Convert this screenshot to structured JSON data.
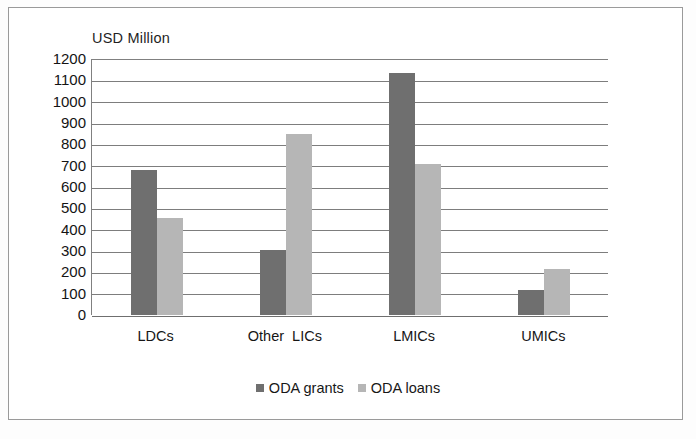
{
  "chart_data": {
    "type": "bar",
    "title": "",
    "subtitle": "",
    "xlabel": "",
    "ylabel": "USD Million",
    "ylim": [
      0,
      1200
    ],
    "ytick_step": 100,
    "yticks": [
      "1200",
      "1100",
      "1000",
      "900",
      "800",
      "700",
      "600",
      "500",
      "400",
      "300",
      "200",
      "100",
      "0"
    ],
    "ytick_values": [
      1200,
      1100,
      1000,
      900,
      800,
      700,
      600,
      500,
      400,
      300,
      200,
      100,
      0
    ],
    "grid": true,
    "legend_position": "bottom",
    "categories": [
      "LDCs",
      "Other  LICs",
      "LMICs",
      "UMICs"
    ],
    "series": [
      {
        "name": "ODA grants",
        "color": "#6f6f6f",
        "values": [
          680,
          305,
          1135,
          115
        ]
      },
      {
        "name": "ODA loans",
        "color": "#b6b6b6",
        "values": [
          455,
          850,
          710,
          215
        ]
      }
    ]
  },
  "figure": {
    "axis_title": "USD Million",
    "frame_color": "#9a9a9a",
    "grid_color": "#7d7d7d",
    "background": "#ffffff"
  },
  "legend": {
    "entries": [
      {
        "label": "ODA grants",
        "swatch": "grants"
      },
      {
        "label": "ODA loans",
        "swatch": "loans"
      }
    ]
  }
}
